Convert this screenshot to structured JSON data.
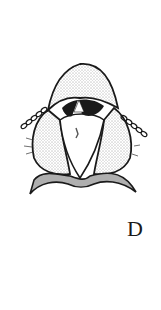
{
  "figure": {
    "panel_label": "D",
    "colors": {
      "ink": "#1a1a1a",
      "background": "#ffffff"
    }
  }
}
